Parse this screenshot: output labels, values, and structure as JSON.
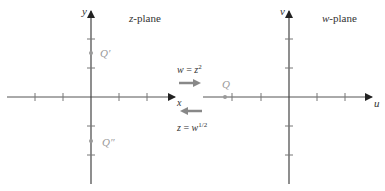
{
  "z_plane": {
    "title_var": "z",
    "title_suffix": "-plane",
    "x_axis_label": "x",
    "y_axis_label": "y",
    "points": [
      {
        "label": "Q′",
        "position": "positive imaginary"
      },
      {
        "label": "Q″",
        "position": "negative imaginary"
      }
    ]
  },
  "w_plane": {
    "title_var": "w",
    "title_suffix": "-plane",
    "x_axis_label": "u",
    "y_axis_label": "v",
    "points": [
      {
        "label": "Q",
        "position": "negative real"
      }
    ]
  },
  "mappings": {
    "forward": {
      "lhs": "w",
      "eq": " = ",
      "base": "z",
      "exp": "2",
      "direction": "right"
    },
    "inverse": {
      "lhs": "z",
      "eq": " = ",
      "base": "w",
      "exp": "1/2",
      "direction": "left"
    }
  },
  "colors": {
    "axis": "#444444",
    "tick": "#666666",
    "point": "#999999",
    "mapping_arrow": "#777777",
    "text": "#333333"
  }
}
